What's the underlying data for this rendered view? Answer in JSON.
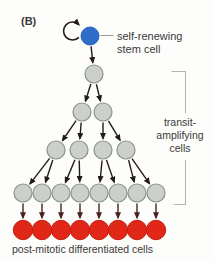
{
  "figure_label": "(B)",
  "annotations": {
    "stem_cell_label": [
      "self-renewing",
      "stem cell"
    ],
    "transit_label": [
      "transit-",
      "amplifying",
      "cells"
    ],
    "post_mitotic_label": "post-mitotic differentiated cells"
  },
  "colors": {
    "background": "#fdfdfb",
    "text": "#3a3a38",
    "stem_cell_fill": "#2e6ecb",
    "stem_cell_stroke": "#2760b4",
    "transit_cell_fill": "#ccd0cb",
    "transit_cell_stroke": "#8d918c",
    "differentiated_cell_fill": "#e02718",
    "differentiated_cell_stroke": "#c41d0e",
    "arrow": "#241c15",
    "differentiation_arrow": "#46221a",
    "bracket": "#b5b5b1",
    "leader_line": "#9c9c98"
  },
  "diagram": {
    "stem_cell": {
      "x": 90,
      "y": 36,
      "r": 9
    },
    "rows": [
      {
        "kind": "transit-amplifying",
        "y": 74,
        "r": 9,
        "xs": [
          94
        ]
      },
      {
        "kind": "transit-amplifying",
        "y": 112,
        "r": 9,
        "xs": [
          82,
          103
        ]
      },
      {
        "kind": "transit-amplifying",
        "y": 150,
        "r": 9,
        "xs": [
          56,
          79,
          103,
          126
        ]
      },
      {
        "kind": "transit-amplifying",
        "y": 193,
        "r": 9,
        "xs": [
          23,
          42,
          61,
          80,
          99,
          118,
          137,
          156
        ]
      },
      {
        "kind": "differentiated",
        "y": 230,
        "r": 9.7,
        "xs": [
          23,
          42,
          61,
          80,
          99,
          118,
          137,
          156
        ]
      }
    ]
  }
}
